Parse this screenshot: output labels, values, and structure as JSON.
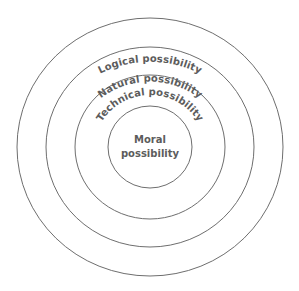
{
  "diagram": {
    "type": "concentric-circles",
    "colors": {
      "background": "#ffffff",
      "stroke": "#6e6e6e",
      "text": "#5c5c5c"
    },
    "rings": [
      {
        "id": "logical",
        "label": "Logical possibility",
        "order": 1
      },
      {
        "id": "natural",
        "label": "Natural possibility",
        "order": 2
      },
      {
        "id": "technical",
        "label": "Technical possibility",
        "order": 3
      }
    ],
    "center": {
      "id": "moral",
      "label_line1": "Moral",
      "label_line2": "possibility"
    }
  }
}
